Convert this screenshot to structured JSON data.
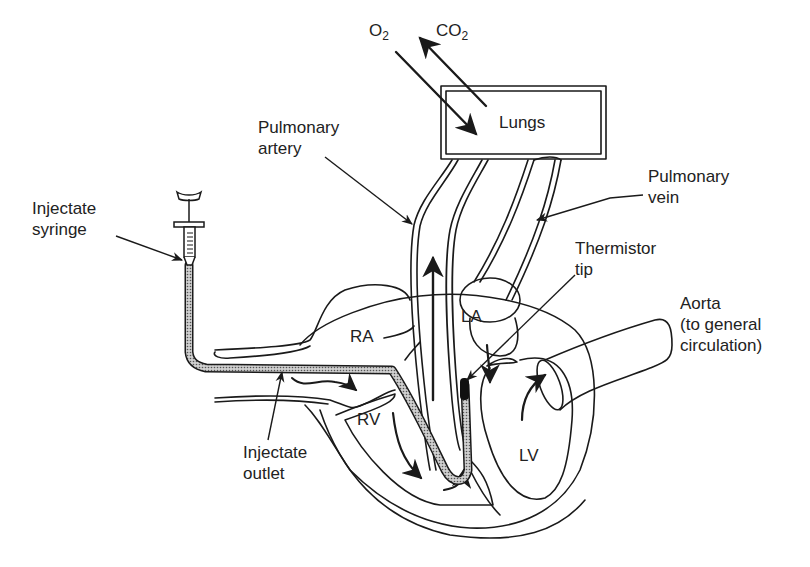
{
  "figure": {
    "type": "diagram",
    "colors": {
      "line": "#1a1a1a",
      "background": "#ffffff",
      "catheter_fill": "#9a9a9a"
    }
  },
  "gases": {
    "o2": {
      "main": "O",
      "sub": "2"
    },
    "co2": {
      "main": "CO",
      "sub": "2"
    }
  },
  "organs": {
    "lungs": "Lungs"
  },
  "labels": {
    "pulmonary_artery": [
      "Pulmonary",
      "artery"
    ],
    "pulmonary_vein": [
      "Pulmonary",
      "vein"
    ],
    "injectate_syringe": [
      "Injectate",
      "syringe"
    ],
    "thermistor_tip": [
      "Thermistor",
      "tip"
    ],
    "aorta": [
      "Aorta",
      "(to general",
      "circulation)"
    ],
    "injectate_outlet": [
      "Injectate",
      "outlet"
    ]
  },
  "chambers": {
    "ra": "RA",
    "rv": "RV",
    "la": "LA",
    "lv": "LV"
  }
}
